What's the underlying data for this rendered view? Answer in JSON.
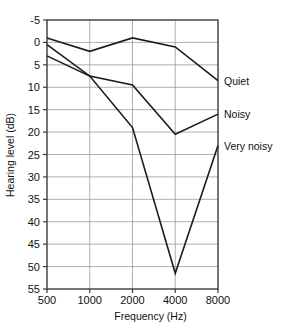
{
  "chart_data": {
    "type": "line",
    "title": "",
    "xlabel": "Frequency (Hz)",
    "ylabel": "Hearing level (dB)",
    "x": [
      500,
      1000,
      2000,
      4000,
      8000
    ],
    "xtick_labels": [
      "500",
      "1000",
      "2000",
      "4000",
      "8000"
    ],
    "xscale": "log",
    "ytick_labels": [
      "-5",
      "0",
      "5",
      "10",
      "15",
      "20",
      "25",
      "30",
      "35",
      "40",
      "45",
      "50",
      "55"
    ],
    "ytick_values": [
      -5,
      0,
      5,
      10,
      15,
      20,
      25,
      30,
      35,
      40,
      45,
      50,
      55
    ],
    "ylim": [
      -5,
      55
    ],
    "y_inverted": true,
    "grid": true,
    "legend_position": "right-inline",
    "series": [
      {
        "name": "Quiet",
        "values": [
          -1,
          2,
          -1,
          1,
          8.5
        ]
      },
      {
        "name": "Noisy",
        "values": [
          0.5,
          7.5,
          9.5,
          20.5,
          16
        ]
      },
      {
        "name": "Very noisy",
        "values": [
          3,
          7.5,
          19,
          51.5,
          23
        ]
      }
    ]
  },
  "labels": {
    "y_axis_title": "Hearing level (dB)",
    "x_axis_title": "Frequency (Hz)",
    "series_quiet": "Quiet",
    "series_noisy": "Noisy",
    "series_very_noisy": "Very noisy"
  },
  "colors": {
    "line": "#1c1c1c",
    "grid": "#8e8e8e",
    "frame": "#3a3a3a",
    "background": "#ffffff"
  }
}
